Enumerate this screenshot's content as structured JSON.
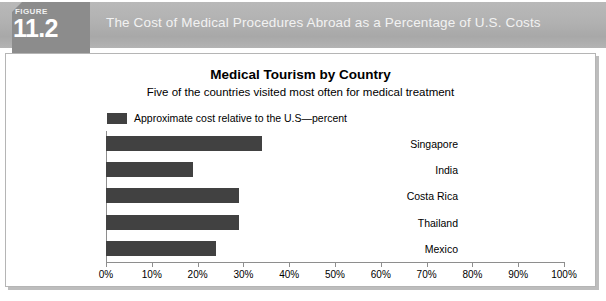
{
  "figure": {
    "badge_label": "FIGURE",
    "badge_number": "11.2",
    "banner_title": "The Cost of Medical Procedures Abroad as a Percentage of U.S. Costs"
  },
  "colors": {
    "bar": "#414141",
    "banner": "#b1b1b1",
    "badge": "#8c8c8c",
    "axis": "#8e8e8e",
    "panel_border": "#b5b5b5"
  },
  "chart_data": {
    "type": "bar",
    "orientation": "horizontal",
    "title": "Medical Tourism by Country",
    "subtitle": "Five of the countries visited most often for medical treatment",
    "xlabel": "",
    "ylabel": "",
    "categories": [
      "Singapore",
      "India",
      "Costa Rica",
      "Thailand",
      "Mexico"
    ],
    "values": [
      34,
      19,
      29,
      29,
      24
    ],
    "xlim": [
      0,
      100
    ],
    "xtick_values": [
      0,
      10,
      20,
      30,
      40,
      50,
      60,
      70,
      80,
      90,
      100
    ],
    "xtick_labels": [
      "0%",
      "10%",
      "20%",
      "30%",
      "40%",
      "50%",
      "60%",
      "70%",
      "80%",
      "90%",
      "100%"
    ],
    "grid": false,
    "legend": {
      "position": "top-left",
      "entries": [
        {
          "label": "Approximate cost relative to the U.S—percent",
          "color": "#414141"
        }
      ]
    }
  }
}
